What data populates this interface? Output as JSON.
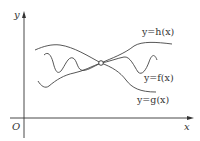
{
  "diagram": {
    "axes": {
      "y_label": "y",
      "x_label": "x",
      "origin_label": "O"
    },
    "curves": [
      {
        "name": "h",
        "label": "y=h(x)"
      },
      {
        "name": "f",
        "label": "y=f(x)"
      },
      {
        "name": "g",
        "label": "y=g(x)"
      }
    ],
    "intersection_marker": "open-circle",
    "colors": {
      "stroke": "#444444",
      "background": "#ffffff"
    }
  }
}
